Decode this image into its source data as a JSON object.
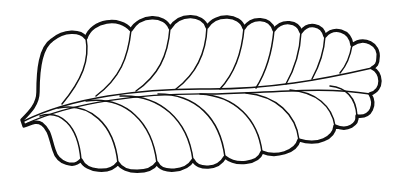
{
  "figure": {
    "colors": {
      "background": "#ffffff",
      "ink": "#111111"
    },
    "top_lobe_count": 9,
    "bottom_lobe_count": 9,
    "tip_lobe_count": 2
  }
}
